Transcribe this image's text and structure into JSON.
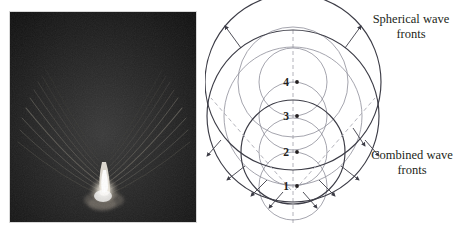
{
  "figure": {
    "type": "physics-illustration",
    "background_color": "#ffffff",
    "panels": [
      "shadowgraph-photo",
      "wavefront-diagram"
    ]
  },
  "photo": {
    "name": "supersonic-projectile-shadowgraph",
    "description": "Shadowgraph photograph of a supersonic projectile producing a V-shaped shock wave cone",
    "background_color": "#1a1a1a",
    "highlight_color": "#f2efe6",
    "border_color": "#d8d8d8",
    "alt": "Dark shadowgraph showing a bright bullet at the vertex of two diverging shock wave fronts"
  },
  "diagram": {
    "line_color": "#3c3c46",
    "thin_line_color": "#8e8e99",
    "dashed_color": "#a9a9b2",
    "axis_label": "",
    "labels": {
      "spherical": "Spherical wave\nfronts",
      "combined": "Combined wave\nfronts"
    },
    "source_points": [
      {
        "id": "1",
        "label": "1",
        "cx": 88,
        "cy": 186
      },
      {
        "id": "2",
        "label": "2",
        "cx": 88,
        "cy": 152
      },
      {
        "id": "3",
        "label": "3",
        "cx": 88,
        "cy": 116
      },
      {
        "id": "4",
        "label": "4",
        "cx": 88,
        "cy": 82
      }
    ],
    "spherical_circles": [
      {
        "source": "1",
        "cx": 88,
        "cy": 186,
        "r": 34,
        "weight": "thin"
      },
      {
        "source": "2",
        "cx": 88,
        "cy": 152,
        "r": 34,
        "weight": "thin"
      },
      {
        "source": "3",
        "cx": 88,
        "cy": 116,
        "r": 34,
        "weight": "thin"
      },
      {
        "source": "4",
        "cx": 88,
        "cy": 82,
        "r": 34,
        "weight": "thin"
      },
      {
        "source": "3-outer",
        "cx": 88,
        "cy": 116,
        "r": 69,
        "weight": "thin"
      },
      {
        "source": "4-outer",
        "cx": 88,
        "cy": 82,
        "r": 55,
        "weight": "thin"
      }
    ],
    "combined_circles": [
      {
        "source": "2",
        "cx": 88,
        "cy": 152,
        "r": 52,
        "weight": "bold"
      },
      {
        "source": "3",
        "cx": 88,
        "cy": 116,
        "r": 86,
        "weight": "bold"
      },
      {
        "source": "4",
        "cx": 88,
        "cy": 82,
        "r": 88,
        "weight": "bold"
      }
    ],
    "mach_lines": [
      {
        "id": "mach-right",
        "x1": 90,
        "y1": 190,
        "x2": 170,
        "y2": 98,
        "style": "dashed"
      },
      {
        "id": "mach-left",
        "x1": 86,
        "y1": 190,
        "x2": 6,
        "y2": 98,
        "style": "dashed"
      }
    ],
    "axis_line": {
      "id": "path-axis",
      "x1": 88,
      "y1": 30,
      "x2": 88,
      "y2": 226,
      "style": "dashed"
    },
    "propagation_arrows": [
      {
        "id": "arrow-up-left",
        "x1": 36,
        "y1": 48,
        "x2": 20,
        "y2": 26
      },
      {
        "id": "arrow-up-right",
        "x1": 140,
        "y1": 48,
        "x2": 156,
        "y2": 26
      },
      {
        "id": "arrow-left",
        "x1": 16,
        "y1": 140,
        "x2": 2,
        "y2": 156
      },
      {
        "id": "arrow-right",
        "x1": 160,
        "y1": 140,
        "x2": 174,
        "y2": 156
      },
      {
        "id": "arrow-lower-left-outer",
        "x1": 40,
        "y1": 166,
        "x2": 22,
        "y2": 180
      },
      {
        "id": "arrow-lower-right-outer",
        "x1": 136,
        "y1": 166,
        "x2": 154,
        "y2": 180
      },
      {
        "id": "arrow-lower-left-inner",
        "x1": 62,
        "y1": 180,
        "x2": 46,
        "y2": 196
      },
      {
        "id": "arrow-lower-right-inner",
        "x1": 114,
        "y1": 180,
        "x2": 130,
        "y2": 196
      },
      {
        "id": "arrow-bottom-left",
        "x1": 78,
        "y1": 192,
        "x2": 64,
        "y2": 208
      },
      {
        "id": "arrow-bottom-right",
        "x1": 98,
        "y1": 192,
        "x2": 112,
        "y2": 208
      },
      {
        "id": "arrow-combined-right",
        "x1": 148,
        "y1": 128,
        "x2": 160,
        "y2": 146
      }
    ]
  }
}
